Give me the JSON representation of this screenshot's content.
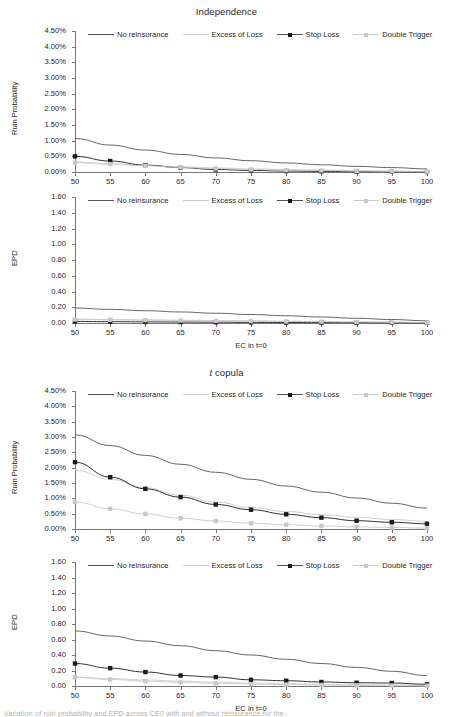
{
  "figure": {
    "caption_fragment": "Variation of ruin probability and EPD across CE0 with and without reinsurance for the"
  },
  "legend": {
    "entries": [
      {
        "label": "No reinsurance",
        "color": "#555555",
        "marker": "none",
        "style": "line"
      },
      {
        "label": "Excess of Loss",
        "color": "#cbcbcb",
        "marker": "none",
        "style": "line"
      },
      {
        "label": "Stop Loss",
        "color": "#1a1a1a",
        "marker": "square",
        "style": "line-marker"
      },
      {
        "label": "Double Trigger",
        "color": "#c9c9c9",
        "marker": "square",
        "style": "line-marker"
      }
    ]
  },
  "axes": {
    "x_label": "EC in t=0",
    "x_ticks": [
      50,
      55,
      60,
      65,
      70,
      75,
      80,
      85,
      90,
      95,
      100
    ],
    "ruin_y_label": "Ruin Probability",
    "ruin_y_ticks": [
      "0.00%",
      "0.50%",
      "1.00%",
      "1.50%",
      "2.00%",
      "2.50%",
      "3.00%",
      "3.50%",
      "4.00%",
      "4.50%"
    ],
    "epd_y_label": "EPD",
    "epd_y_ticks": [
      "0.00",
      "0.20",
      "0.40",
      "0.60",
      "0.80",
      "1.00",
      "1.20",
      "1.40",
      "1.60"
    ]
  },
  "chart_data": [
    {
      "type": "line",
      "panel_index": 0,
      "title": "Independence",
      "title_italic_prefix": "",
      "xlabel": "",
      "ylabel": "Ruin Probability",
      "x": [
        50,
        55,
        60,
        65,
        70,
        75,
        80,
        85,
        90,
        95,
        100
      ],
      "xlim": [
        50,
        100
      ],
      "ylim": [
        0,
        4.5
      ],
      "yunit": "%",
      "grid": false,
      "legend_position": "top-inside",
      "series": [
        {
          "name": "No reinsurance",
          "color": "#555555",
          "marker": "none",
          "values": [
            1.07,
            0.86,
            0.7,
            0.56,
            0.45,
            0.36,
            0.29,
            0.23,
            0.18,
            0.14,
            0.1
          ]
        },
        {
          "name": "Excess of Loss",
          "color": "#cbcbcb",
          "marker": "none",
          "values": [
            0.32,
            0.26,
            0.21,
            0.17,
            0.13,
            0.1,
            0.08,
            0.06,
            0.05,
            0.03,
            0.02
          ]
        },
        {
          "name": "Stop Loss",
          "color": "#1a1a1a",
          "marker": "square",
          "values": [
            0.5,
            0.35,
            0.22,
            0.14,
            0.08,
            0.05,
            0.03,
            0.02,
            0.01,
            0.01,
            0.0
          ]
        },
        {
          "name": "Double Trigger",
          "color": "#c9c9c9",
          "marker": "square",
          "values": [
            0.3,
            0.25,
            0.2,
            0.15,
            0.11,
            0.08,
            0.06,
            0.05,
            0.03,
            0.02,
            0.01
          ]
        }
      ]
    },
    {
      "type": "line",
      "panel_index": 1,
      "title": "",
      "title_italic_prefix": "",
      "xlabel": "EC in t=0",
      "ylabel": "EPD",
      "x": [
        50,
        55,
        60,
        65,
        70,
        75,
        80,
        85,
        90,
        95,
        100
      ],
      "xlim": [
        50,
        100
      ],
      "ylim": [
        0,
        1.6
      ],
      "yunit": "",
      "grid": false,
      "legend_position": "top-inside",
      "series": [
        {
          "name": "No reinsurance",
          "color": "#555555",
          "marker": "none",
          "values": [
            0.19,
            0.173,
            0.156,
            0.14,
            0.124,
            0.108,
            0.092,
            0.076,
            0.06,
            0.044,
            0.028
          ]
        },
        {
          "name": "Excess of Loss",
          "color": "#cbcbcb",
          "marker": "none",
          "values": [
            0.05,
            0.045,
            0.04,
            0.036,
            0.031,
            0.027,
            0.023,
            0.019,
            0.015,
            0.011,
            0.007
          ]
        },
        {
          "name": "Stop Loss",
          "color": "#1a1a1a",
          "marker": "square",
          "values": [
            0.02,
            0.017,
            0.014,
            0.012,
            0.01,
            0.008,
            0.006,
            0.005,
            0.004,
            0.003,
            0.002
          ]
        },
        {
          "name": "Double Trigger",
          "color": "#c9c9c9",
          "marker": "square",
          "values": [
            0.045,
            0.04,
            0.036,
            0.032,
            0.028,
            0.024,
            0.02,
            0.017,
            0.013,
            0.01,
            0.006
          ]
        }
      ]
    },
    {
      "type": "line",
      "panel_index": 2,
      "title": "t copula",
      "title_italic_prefix": "t",
      "xlabel": "",
      "ylabel": "Ruin Probability",
      "x": [
        50,
        55,
        60,
        65,
        70,
        75,
        80,
        85,
        90,
        95,
        100
      ],
      "xlim": [
        50,
        100
      ],
      "ylim": [
        0,
        4.5
      ],
      "yunit": "%",
      "grid": false,
      "legend_position": "top-inside",
      "series": [
        {
          "name": "No reinsurance",
          "color": "#555555",
          "marker": "none",
          "values": [
            3.07,
            2.72,
            2.4,
            2.11,
            1.85,
            1.62,
            1.4,
            1.2,
            1.01,
            0.84,
            0.68
          ]
        },
        {
          "name": "Excess of Loss",
          "color": "#cbcbcb",
          "marker": "none",
          "values": [
            1.92,
            1.62,
            1.35,
            1.1,
            0.88,
            0.7,
            0.57,
            0.47,
            0.38,
            0.31,
            0.25
          ]
        },
        {
          "name": "Stop Loss",
          "color": "#1a1a1a",
          "marker": "square",
          "values": [
            2.18,
            1.69,
            1.31,
            1.04,
            0.8,
            0.63,
            0.48,
            0.37,
            0.27,
            0.22,
            0.17
          ]
        },
        {
          "name": "Double Trigger",
          "color": "#c9c9c9",
          "marker": "square",
          "values": [
            0.88,
            0.66,
            0.49,
            0.35,
            0.26,
            0.19,
            0.14,
            0.1,
            0.07,
            0.05,
            0.03
          ]
        }
      ]
    },
    {
      "type": "line",
      "panel_index": 3,
      "title": "",
      "title_italic_prefix": "",
      "xlabel": "EC in t=0",
      "ylabel": "EPD",
      "x": [
        50,
        55,
        60,
        65,
        70,
        75,
        80,
        85,
        90,
        95,
        100
      ],
      "xlim": [
        50,
        100
      ],
      "ylim": [
        0,
        1.6
      ],
      "yunit": "",
      "grid": false,
      "legend_position": "top-inside",
      "series": [
        {
          "name": "No reinsurance",
          "color": "#555555",
          "marker": "none",
          "values": [
            0.71,
            0.645,
            0.58,
            0.52,
            0.455,
            0.4,
            0.345,
            0.29,
            0.24,
            0.19,
            0.135
          ]
        },
        {
          "name": "Excess of Loss",
          "color": "#cbcbcb",
          "marker": "none",
          "values": [
            0.115,
            0.095,
            0.078,
            0.063,
            0.05,
            0.039,
            0.03,
            0.023,
            0.017,
            0.012,
            0.008
          ]
        },
        {
          "name": "Stop Loss",
          "color": "#1a1a1a",
          "marker": "square",
          "values": [
            0.29,
            0.23,
            0.18,
            0.135,
            0.115,
            0.08,
            0.068,
            0.052,
            0.042,
            0.038,
            0.022
          ]
        },
        {
          "name": "Double Trigger",
          "color": "#c9c9c9",
          "marker": "square",
          "values": [
            0.11,
            0.085,
            0.063,
            0.046,
            0.034,
            0.025,
            0.018,
            0.013,
            0.009,
            0.006,
            0.004
          ]
        }
      ]
    }
  ]
}
